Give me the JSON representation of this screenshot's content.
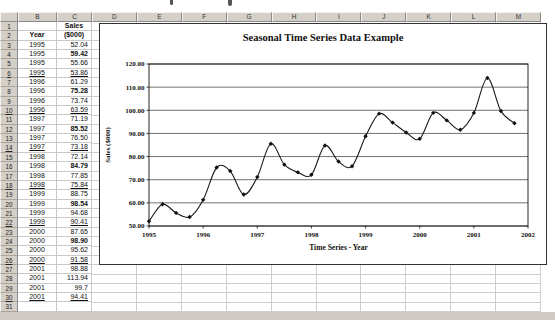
{
  "sheet": {
    "column_headers": [
      "B",
      "C",
      "D",
      "E",
      "F",
      "G",
      "H",
      "I",
      "J",
      "K",
      "L",
      "M"
    ],
    "row_count": 31,
    "year_header": "Year",
    "sales_header_line1": "Sales",
    "sales_header_line2": "($000)",
    "rows": [
      {
        "row": 3,
        "year": "1995",
        "sales": "52.04"
      },
      {
        "row": 4,
        "year": "1995",
        "sales": "59.42",
        "bold": true
      },
      {
        "row": 5,
        "year": "1995",
        "sales": "55.66"
      },
      {
        "row": 6,
        "year": "1995",
        "sales": "53.86",
        "underline": true
      },
      {
        "row": 7,
        "year": "1996",
        "sales": "61.29"
      },
      {
        "row": 8,
        "year": "1996",
        "sales": "75.28",
        "bold": true
      },
      {
        "row": 9,
        "year": "1996",
        "sales": "73.74"
      },
      {
        "row": 10,
        "year": "1996",
        "sales": "63.59",
        "underline": true
      },
      {
        "row": 11,
        "year": "1997",
        "sales": "71.19"
      },
      {
        "row": 12,
        "year": "1997",
        "sales": "85.52",
        "bold": true
      },
      {
        "row": 13,
        "year": "1997",
        "sales": "76.50"
      },
      {
        "row": 14,
        "year": "1997",
        "sales": "73.18",
        "underline": true
      },
      {
        "row": 15,
        "year": "1998",
        "sales": "72.14"
      },
      {
        "row": 16,
        "year": "1998",
        "sales": "84.79",
        "bold": true
      },
      {
        "row": 17,
        "year": "1998",
        "sales": "77.85"
      },
      {
        "row": 18,
        "year": "1998",
        "sales": "75.84",
        "underline": true
      },
      {
        "row": 19,
        "year": "1999",
        "sales": "88.75"
      },
      {
        "row": 20,
        "year": "1999",
        "sales": "98.54",
        "bold": true
      },
      {
        "row": 21,
        "year": "1999",
        "sales": "94.68"
      },
      {
        "row": 22,
        "year": "1999",
        "sales": "90.41",
        "underline": true
      },
      {
        "row": 23,
        "year": "2000",
        "sales": "87.65"
      },
      {
        "row": 24,
        "year": "2000",
        "sales": "98.90",
        "bold": true
      },
      {
        "row": 25,
        "year": "2000",
        "sales": "95.62"
      },
      {
        "row": 26,
        "year": "2000",
        "sales": "91.58",
        "underline": true
      },
      {
        "row": 27,
        "year": "2001",
        "sales": "98.88"
      },
      {
        "row": 28,
        "year": "2001",
        "sales": "113.94"
      },
      {
        "row": 29,
        "year": "2001",
        "sales": "99.7"
      },
      {
        "row": 30,
        "year": "2001",
        "sales": "94.41",
        "underline": true
      }
    ]
  },
  "chart_data": {
    "type": "line",
    "title": "Seasonal Time Series Data Example",
    "xlabel": "Time Series - Year",
    "ylabel": "Sales ($000)",
    "x_ticks": [
      "1995",
      "1996",
      "1997",
      "1998",
      "1999",
      "2000",
      "2001",
      "2002"
    ],
    "y_ticks": [
      "120.00",
      "110.00",
      "100.00",
      "90.00",
      "80.00",
      "70.00",
      "60.00",
      "50.00"
    ],
    "ylim": [
      50,
      120
    ],
    "xlim": [
      1995,
      2002
    ],
    "x_start": 1995,
    "points_per_year": 4,
    "values": [
      52.04,
      59.42,
      55.66,
      53.86,
      61.29,
      75.28,
      73.74,
      63.59,
      71.19,
      85.52,
      76.5,
      73.18,
      72.14,
      84.79,
      77.85,
      75.84,
      88.75,
      98.54,
      94.68,
      90.41,
      87.65,
      98.9,
      95.62,
      91.58,
      98.88,
      113.94,
      99.7,
      94.41
    ],
    "grid": "horizontal",
    "legend": "none",
    "marker": "diamond",
    "line_smoothed": true,
    "line_color": "#1a1a1a",
    "gridline_color": "#4d4d4d"
  }
}
